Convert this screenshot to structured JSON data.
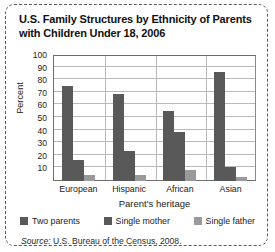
{
  "figure": {
    "title": "U.S. Family Structures by Ethnicity of Parents with Children Under 18, 2006",
    "source_word": "Source:",
    "source_text": " U.S. Bureau of the Census, 2008."
  },
  "chart_data": {
    "type": "bar",
    "title": "U.S. Family Structures by Ethnicity of Parents with Children Under 18, 2006",
    "xlabel": "Parent's heritage",
    "ylabel": "Percent",
    "categories": [
      "European",
      "Hispanic",
      "African",
      "Asian"
    ],
    "series": [
      {
        "name": "Two parents",
        "values": [
          76,
          70,
          56,
          87
        ],
        "color": "#595959"
      },
      {
        "name": "Single mother",
        "values": [
          17,
          24,
          39,
          11
        ],
        "color": "#595959"
      },
      {
        "name": "Single father",
        "values": [
          5,
          5,
          9,
          3
        ],
        "color": "#9a9a9a"
      }
    ],
    "ylim": [
      0,
      100
    ],
    "yticks": [
      10,
      20,
      30,
      40,
      50,
      60,
      70,
      80,
      90,
      100
    ],
    "ytick_labels": [
      "10",
      "20",
      "30",
      "40",
      "50",
      "60",
      "70",
      "80",
      "90",
      "100"
    ],
    "grid": "horizontal",
    "legend_position": "bottom"
  },
  "colors": {
    "bar_dark": "#595959",
    "bar_light": "#9a9a9a",
    "gridline": "#b9b9b9",
    "frame": "#6e6e6e",
    "border": "#5a5a5a"
  }
}
